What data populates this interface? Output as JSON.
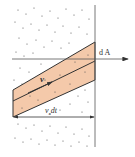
{
  "diagram": {
    "labels": {
      "area": "d A",
      "velocity": "v",
      "displacement": "v",
      "displacement_sub": "x",
      "displacement_tail": "dt"
    },
    "colors": {
      "band_fill": "#f4c9aa",
      "line": "#333333",
      "dots": "#555555",
      "background": "#ffffff"
    }
  }
}
